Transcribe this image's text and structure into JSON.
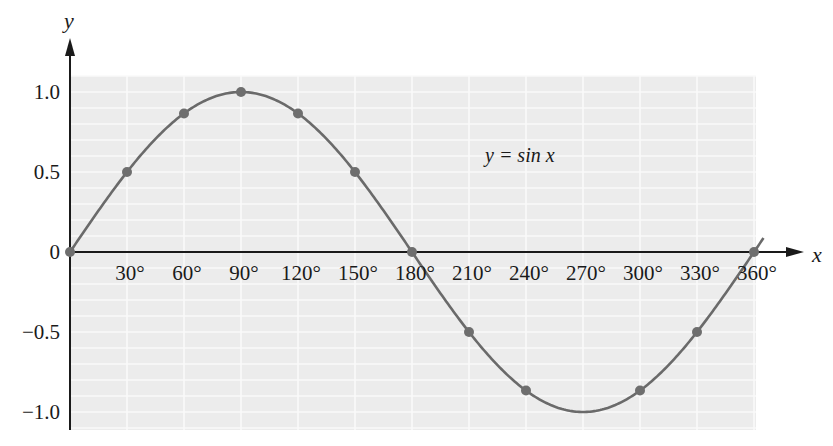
{
  "chart_data": {
    "type": "line",
    "title": "",
    "annotation": "y = sin x",
    "xlabel": "x",
    "ylabel": "y",
    "x": [
      0,
      30,
      60,
      90,
      120,
      150,
      180,
      210,
      240,
      270,
      300,
      330,
      360
    ],
    "x_tick_labels": [
      "30°",
      "60°",
      "90°",
      "120°",
      "150°",
      "180°",
      "210°",
      "240°",
      "270°",
      "300°",
      "330°",
      "360°"
    ],
    "y_ticks": [
      1.0,
      0.5,
      0,
      -0.5,
      -1.0
    ],
    "y_tick_labels": [
      "1.0",
      "0.5",
      "0",
      "−0.5",
      "−1.0"
    ],
    "series": [
      {
        "name": "y = sin x",
        "marker_points": [
          {
            "x": 0,
            "y": 0
          },
          {
            "x": 30,
            "y": 0.5
          },
          {
            "x": 60,
            "y": 0.866
          },
          {
            "x": 90,
            "y": 1.0
          },
          {
            "x": 120,
            "y": 0.866
          },
          {
            "x": 150,
            "y": 0.5
          },
          {
            "x": 180,
            "y": 0
          },
          {
            "x": 210,
            "y": -0.5
          },
          {
            "x": 240,
            "y": -0.866
          },
          {
            "x": 300,
            "y": -0.866
          },
          {
            "x": 330,
            "y": -0.5
          },
          {
            "x": 360,
            "y": 0
          }
        ]
      }
    ],
    "xlim": [
      0,
      365
    ],
    "ylim": [
      -1.1,
      1.1
    ],
    "grid": true,
    "grid_minor_y": 0.1,
    "grid_x_step": 30,
    "colors": {
      "curve": "#6a6a6a",
      "marker": "#6e6e6e",
      "grid_bg": "#ececec",
      "grid_line": "#fafafa",
      "axis": "#1a1a1a"
    }
  }
}
